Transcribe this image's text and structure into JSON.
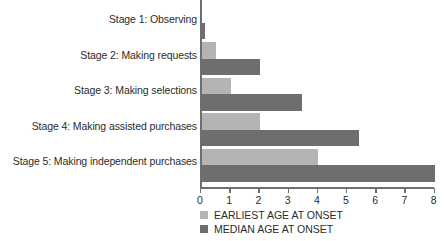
{
  "chart_data": {
    "type": "bar",
    "orientation": "horizontal",
    "title": "",
    "subtitle": "",
    "xlabel": "",
    "ylabel": "",
    "xlim": [
      0,
      8
    ],
    "xticks": [
      0,
      1,
      2,
      3,
      4,
      5,
      6,
      7,
      8
    ],
    "xtick_labels": [
      "0",
      "1",
      "2",
      "3",
      "4",
      "5",
      "6",
      "7",
      "8"
    ],
    "grid": false,
    "legend_position": "bottom-left",
    "categories": [
      "Stage 1: Observing",
      "Stage 2: Making requests",
      "Stage 3: Making selections",
      "Stage 4: Making assisted purchases",
      "Stage 5: Making independent purchases"
    ],
    "series": [
      {
        "name": "EARLIEST AGE AT ONSET",
        "color": "#b4b4b4",
        "values": [
          0,
          0.5,
          1.0,
          2.0,
          4.0
        ]
      },
      {
        "name": "MEDIAN AGE AT ONSET",
        "color": "#6e6e6e",
        "values": [
          0.12,
          2.0,
          3.45,
          5.4,
          8.0
        ]
      }
    ]
  },
  "legend": {
    "items": [
      {
        "label": "EARLIEST AGE AT ONSET",
        "color": "#b4b4b4"
      },
      {
        "label": "MEDIAN AGE AT ONSET",
        "color": "#6e6e6e"
      }
    ]
  },
  "colors": {
    "earliest": "#b4b4b4",
    "median": "#6e6e6e",
    "axis": "#6f6f6f",
    "text": "#2b2b2b",
    "background": "#ffffff"
  }
}
